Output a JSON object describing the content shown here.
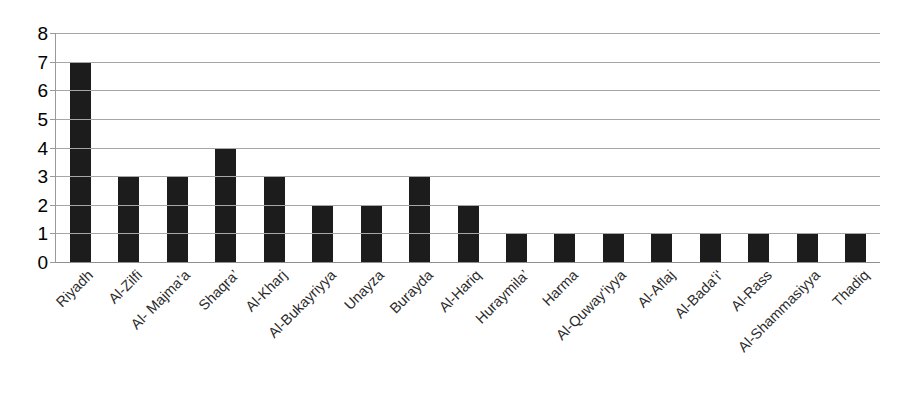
{
  "chart_data": {
    "type": "bar",
    "title": "",
    "subtitle": "",
    "xlabel": "",
    "ylabel": "",
    "ylim": [
      0,
      8
    ],
    "y_ticks": [
      0,
      1,
      2,
      3,
      4,
      5,
      6,
      7,
      8
    ],
    "grid": true,
    "grid_axis": "y",
    "legend": false,
    "legend_position": "none",
    "bar_color": "#1c1c1c",
    "gridline_color": "#a6a6a6",
    "axis_color": "#9a9a9a",
    "label_rotation_degrees": -45,
    "categories": [
      "Riyadh",
      "Al-Zilfi",
      "Al- Majma’a",
      "Shaqra’",
      "Al-Kharj",
      "Al-Bukayriyya",
      "Unayza",
      "Burayda",
      "Al-Hariq",
      "Huraymila’",
      "Harma",
      "Al-Quway‘iyya",
      "Al-Aflaj",
      "Al-Bada‘i‘",
      "Al-Rass",
      "Al-Shammasiyya",
      "Thadiq"
    ],
    "values": [
      7,
      3,
      3,
      4,
      3,
      2,
      2,
      3,
      2,
      1,
      1,
      1,
      1,
      1,
      1,
      1,
      1
    ]
  }
}
